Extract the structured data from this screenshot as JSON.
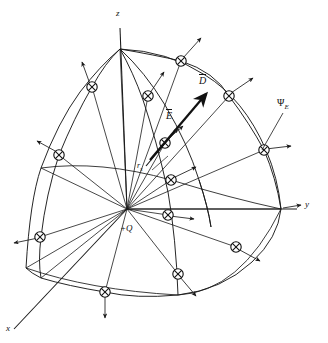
{
  "figure": {
    "axes": {
      "z_label": "z",
      "y_label": "y",
      "x_label": "x"
    },
    "labels": {
      "flux_density": "D",
      "electric_field": "E",
      "flux_symbol": "Ψ",
      "flux_subscript": "E",
      "radius": "r",
      "radius_subscript": "s",
      "charge": "+Q"
    },
    "colors": {
      "line": "#1a1a1a",
      "background": "#ffffff",
      "marker_stroke": "#111111"
    },
    "geometry": {
      "origin_x": 127,
      "origin_y": 209,
      "z_top_x": 120,
      "z_top_y": 49,
      "y_end_x": 297,
      "y_end_y": 209,
      "x_end_x": 14,
      "x_end_y": 329,
      "marker_count": 13,
      "ray_count": 13
    },
    "markers": [
      {
        "name": "marker-z-upper-right",
        "x": 181,
        "y": 61
      },
      {
        "name": "marker-upper-left",
        "x": 92,
        "y": 87
      },
      {
        "name": "marker-upper-mid",
        "x": 148,
        "y": 96
      },
      {
        "name": "marker-right-upper",
        "x": 229,
        "y": 96
      },
      {
        "name": "marker-mid-right-arc",
        "x": 165,
        "y": 143
      },
      {
        "name": "marker-left-mid",
        "x": 59,
        "y": 155
      },
      {
        "name": "marker-far-right",
        "x": 264,
        "y": 150
      },
      {
        "name": "marker-center-right",
        "x": 171,
        "y": 180
      },
      {
        "name": "marker-lower-center",
        "x": 168,
        "y": 215
      },
      {
        "name": "marker-lower-left",
        "x": 40,
        "y": 237
      },
      {
        "name": "marker-lower-right",
        "x": 236,
        "y": 247
      },
      {
        "name": "marker-bottom-mid",
        "x": 178,
        "y": 274
      },
      {
        "name": "marker-bottom-left",
        "x": 105,
        "y": 292
      }
    ],
    "bleed_text": {
      "top": "",
      "bottom": ""
    }
  }
}
